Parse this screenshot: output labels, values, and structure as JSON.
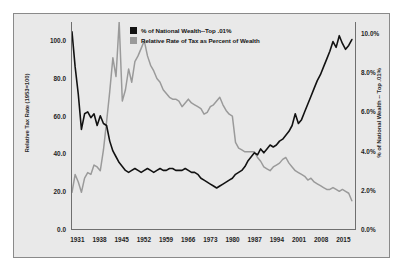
{
  "chart_data": {
    "type": "line",
    "title": "",
    "subtitle": "",
    "xlabel": "",
    "ylabel": "Relative Tax Rate (1953=100)",
    "ylabel_secondary": "% of National Wealth -- Top .01%",
    "grid": false,
    "legend_position": "top-center",
    "xlim": [
      1929,
      2019
    ],
    "ylim": [
      0,
      110
    ],
    "ylim_secondary": [
      0.0,
      10.6
    ],
    "xticks": [
      1931,
      1938,
      1945,
      1952,
      1959,
      1966,
      1973,
      1980,
      1987,
      1994,
      2001,
      2008,
      2015
    ],
    "xtick_labels": [
      "1931",
      "1938",
      "1945",
      "1952",
      "1959",
      "1966",
      "1973",
      "1980",
      "1987",
      "1994",
      "2001",
      "2008",
      "2015"
    ],
    "yticks_left": [
      0.0,
      20.0,
      40.0,
      60.0,
      80.0,
      100.0
    ],
    "ytick_labels_left": [
      "0.0",
      "20.0",
      "40.0",
      "60.0",
      "80.0",
      "100.0"
    ],
    "yticks_right": [
      0.0,
      2.0,
      4.0,
      6.0,
      8.0,
      10.0
    ],
    "ytick_labels_right": [
      "0.0%",
      "2.0%",
      "4.0%",
      "6.0%",
      "8.0%",
      "10.0%"
    ],
    "series": [
      {
        "name": "% of National Wealth--Top .01%",
        "color": "#121212",
        "axis": "right",
        "units": "percent",
        "x": [
          1929,
          1930,
          1931,
          1932,
          1933,
          1934,
          1935,
          1936,
          1937,
          1938,
          1939,
          1940,
          1941,
          1942,
          1943,
          1944,
          1945,
          1946,
          1947,
          1948,
          1949,
          1950,
          1951,
          1952,
          1953,
          1954,
          1955,
          1956,
          1957,
          1958,
          1959,
          1960,
          1961,
          1962,
          1963,
          1964,
          1965,
          1966,
          1967,
          1968,
          1969,
          1970,
          1971,
          1972,
          1973,
          1974,
          1975,
          1976,
          1977,
          1978,
          1979,
          1980,
          1981,
          1982,
          1983,
          1984,
          1985,
          1986,
          1987,
          1988,
          1989,
          1990,
          1991,
          1992,
          1993,
          1994,
          1995,
          1996,
          1997,
          1998,
          1999,
          2000,
          2001,
          2002,
          2003,
          2004,
          2005,
          2006,
          2007,
          2008,
          2009,
          2010,
          2011,
          2012,
          2013,
          2014,
          2015,
          2016,
          2017,
          2018
        ],
        "values": [
          10.1,
          8.3,
          6.9,
          5.1,
          5.9,
          6.0,
          5.7,
          5.9,
          5.3,
          5.8,
          5.4,
          5.3,
          4.5,
          4.0,
          3.7,
          3.4,
          3.2,
          3.0,
          2.9,
          3.0,
          3.1,
          3.0,
          2.9,
          3.0,
          3.1,
          3.0,
          2.9,
          3.0,
          3.1,
          3.0,
          3.0,
          3.1,
          3.1,
          3.0,
          3.0,
          3.0,
          3.1,
          3.0,
          2.9,
          2.9,
          2.8,
          2.6,
          2.5,
          2.4,
          2.3,
          2.2,
          2.1,
          2.2,
          2.3,
          2.4,
          2.5,
          2.6,
          2.8,
          2.9,
          3.0,
          3.2,
          3.5,
          3.7,
          3.9,
          3.8,
          4.1,
          3.9,
          4.1,
          4.3,
          4.2,
          4.3,
          4.5,
          4.6,
          4.8,
          5.0,
          5.3,
          5.9,
          5.4,
          5.6,
          6.0,
          6.4,
          6.8,
          7.2,
          7.6,
          7.9,
          8.3,
          8.7,
          9.1,
          9.6,
          9.3,
          9.9,
          9.5,
          9.2,
          9.4,
          9.7
        ]
      },
      {
        "name": "Relative Rate of Tax as Percent of Wealth",
        "color": "#9a9a9a",
        "axis": "left",
        "units": "index_1953_equals_100",
        "x": [
          1929,
          1930,
          1931,
          1932,
          1933,
          1934,
          1935,
          1936,
          1937,
          1938,
          1939,
          1940,
          1941,
          1942,
          1943,
          1944,
          1945,
          1946,
          1947,
          1948,
          1949,
          1950,
          1951,
          1952,
          1953,
          1954,
          1955,
          1956,
          1957,
          1958,
          1959,
          1960,
          1961,
          1962,
          1963,
          1964,
          1965,
          1966,
          1967,
          1968,
          1969,
          1970,
          1971,
          1972,
          1973,
          1974,
          1975,
          1976,
          1977,
          1978,
          1979,
          1980,
          1981,
          1982,
          1983,
          1984,
          1985,
          1986,
          1987,
          1988,
          1989,
          1990,
          1991,
          1992,
          1993,
          1994,
          1995,
          1996,
          1997,
          1998,
          1999,
          2000,
          2001,
          2002,
          2003,
          2004,
          2005,
          2006,
          2007,
          2008,
          2009,
          2010,
          2011,
          2012,
          2013,
          2014,
          2015,
          2016,
          2017,
          2018
        ],
        "values": [
          19.5,
          29.0,
          25.0,
          19.5,
          27.0,
          30.0,
          29.0,
          34.0,
          33.0,
          31.0,
          42.0,
          57.0,
          73.0,
          91.0,
          81.0,
          110.0,
          68.0,
          74.0,
          85.0,
          78.0,
          89.0,
          92.0,
          96.0,
          100.0,
          92.0,
          87.0,
          84.0,
          80.0,
          78.0,
          74.0,
          72.0,
          70.0,
          69.0,
          69.0,
          68.0,
          65.0,
          67.0,
          69.0,
          67.0,
          66.0,
          65.0,
          64.0,
          61.0,
          62.0,
          65.0,
          66.0,
          68.0,
          70.0,
          66.0,
          63.0,
          61.0,
          60.0,
          46.0,
          43.0,
          42.0,
          41.0,
          41.0,
          41.0,
          41.0,
          38.0,
          36.0,
          33.0,
          32.0,
          31.0,
          33.0,
          34.0,
          35.0,
          37.0,
          38.0,
          35.0,
          33.0,
          31.0,
          30.0,
          29.0,
          28.0,
          26.0,
          27.0,
          25.0,
          24.0,
          23.0,
          22.0,
          21.0,
          21.0,
          22.0,
          21.0,
          20.0,
          21.0,
          20.0,
          19.0,
          15.0
        ]
      }
    ]
  },
  "legend": {
    "items": [
      {
        "label": "% of National Wealth--Top .01%",
        "color": "#121212"
      },
      {
        "label": "Relative Rate of Tax as Percent of Wealth",
        "color": "#9a9a9a"
      }
    ]
  }
}
